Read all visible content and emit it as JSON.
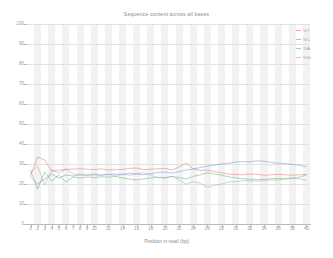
{
  "chart_data": {
    "type": "line",
    "title": "Sequence content across all bases",
    "xlabel": "Position in read (bp)",
    "ylabel": "",
    "xlim": [
      1,
      40
    ],
    "ylim": [
      0,
      100
    ],
    "grid": true,
    "legend_position": "top-right",
    "x": [
      1,
      2,
      3,
      4,
      5,
      6,
      7,
      8,
      9,
      10,
      11,
      12,
      13,
      14,
      15,
      16,
      17,
      18,
      19,
      20,
      21,
      22,
      23,
      24,
      25,
      26,
      27,
      28,
      29,
      30,
      31,
      32,
      33,
      34,
      35,
      36,
      37,
      38,
      39,
      40
    ],
    "x_tick_labels": [
      "1",
      "2",
      "3",
      "4",
      "5",
      "6",
      "7",
      "8",
      "9",
      "10",
      "12",
      "14",
      "16",
      "18",
      "20",
      "22",
      "24",
      "26",
      "28",
      "30",
      "32",
      "34",
      "36",
      "38",
      "40"
    ],
    "y_tick_labels": [
      "0",
      "10",
      "20",
      "30",
      "40",
      "50",
      "60",
      "70",
      "80",
      "90",
      "100"
    ],
    "series": [
      {
        "name": "%T",
        "color": "#cf4a4a",
        "values": [
          24.0,
          33.5,
          32.0,
          26.5,
          27.0,
          27.3,
          27.5,
          27.6,
          27.4,
          27.2,
          27.6,
          27.0,
          27.2,
          27.3,
          27.8,
          28.0,
          27.2,
          27.4,
          27.6,
          27.8,
          27.0,
          28.5,
          30.5,
          27.5,
          26.8,
          27.0,
          26.2,
          25.6,
          25.0,
          24.8,
          24.6,
          25.0,
          24.8,
          24.4,
          24.6,
          24.8,
          24.6,
          24.4,
          24.6,
          24.8
        ]
      },
      {
        "name": "%C",
        "color": "#3f6fc4",
        "values": [
          23.5,
          20.0,
          22.5,
          25.0,
          23.0,
          24.5,
          24.0,
          24.5,
          24.2,
          24.6,
          24.4,
          24.8,
          25.0,
          24.6,
          25.4,
          25.0,
          24.6,
          25.2,
          25.8,
          26.0,
          25.4,
          26.2,
          27.0,
          27.5,
          28.2,
          29.0,
          29.5,
          30.0,
          30.4,
          31.0,
          31.2,
          31.0,
          31.6,
          31.4,
          30.8,
          30.4,
          30.2,
          29.8,
          29.4,
          28.6
        ]
      },
      {
        "name": "%A",
        "color": "#2f9f3f",
        "values": [
          27.0,
          17.5,
          26.0,
          21.5,
          24.5,
          21.0,
          23.5,
          23.0,
          23.5,
          23.2,
          23.6,
          23.4,
          23.8,
          23.0,
          22.5,
          22.0,
          22.6,
          23.0,
          23.4,
          23.0,
          23.8,
          23.2,
          22.6,
          23.8,
          24.6,
          25.6,
          25.0,
          24.4,
          23.6,
          23.0,
          22.6,
          22.4,
          22.2,
          22.4,
          22.6,
          22.8,
          22.8,
          23.0,
          23.4,
          24.6
        ]
      },
      {
        "name": "%G",
        "color": "#8d8d8d",
        "values": [
          25.5,
          29.0,
          19.5,
          27.0,
          25.5,
          27.5,
          25.0,
          24.9,
          24.9,
          25.0,
          24.4,
          24.8,
          24.0,
          25.1,
          24.3,
          25.0,
          25.6,
          24.4,
          23.2,
          23.2,
          23.8,
          22.1,
          19.9,
          21.2,
          20.4,
          18.4,
          19.3,
          20.0,
          21.0,
          21.2,
          21.6,
          21.6,
          21.4,
          21.8,
          22.0,
          22.0,
          22.4,
          22.8,
          22.6,
          22.0
        ]
      }
    ]
  }
}
